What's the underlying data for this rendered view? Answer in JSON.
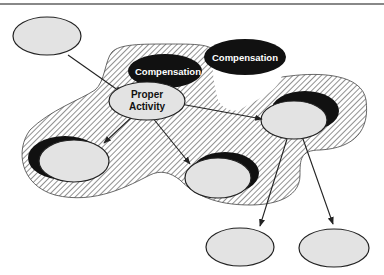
{
  "diagram": {
    "type": "compensation-scope-diagram",
    "colors": {
      "hatch_line": "#555555",
      "node_fill": "#e3e3e3",
      "node_stroke": "#222222",
      "compensation_fill": "#111111",
      "compensation_text": "#ffffff"
    },
    "nodes": {
      "proper_activity": {
        "line1": "Proper",
        "line2": "Activity"
      },
      "compensation_inner": {
        "label": "Compensation"
      },
      "compensation_outer": {
        "label": "Compensation"
      }
    },
    "edges": [
      {
        "from": "top-left-activity",
        "to": "proper-activity"
      },
      {
        "from": "proper-activity",
        "to": "left-activity"
      },
      {
        "from": "proper-activity",
        "to": "middle-activity"
      },
      {
        "from": "proper-activity",
        "to": "right-activity"
      },
      {
        "from": "right-activity",
        "to": "bottom-left-activity"
      },
      {
        "from": "right-activity",
        "to": "bottom-right-activity"
      }
    ]
  }
}
